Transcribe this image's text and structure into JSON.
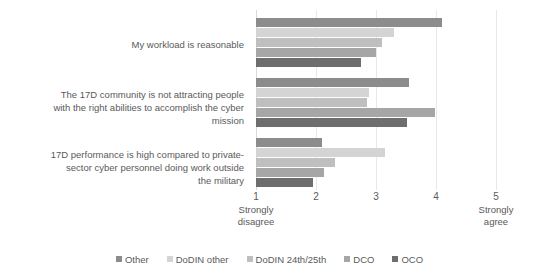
{
  "chart_data": {
    "type": "bar",
    "orientation": "horizontal",
    "title": "",
    "xlabel": "",
    "ylabel": "",
    "xlim": [
      1,
      5
    ],
    "xticks": [
      1,
      2,
      3,
      4,
      5
    ],
    "xtick_labels": [
      "1",
      "2",
      "3",
      "4",
      "5"
    ],
    "xtick_sublabels": [
      [
        "Strongly",
        "disagree"
      ],
      [],
      [],
      [],
      [
        "Strongly",
        "agree"
      ]
    ],
    "grid": true,
    "legend_position": "bottom",
    "categories": [
      "My workload is reasonable",
      "The 17D community is not attracting people with the right abilities to accomplish the cyber mission",
      "17D performance is high compared to private-sector cyber personnel doing work outside the military"
    ],
    "category_lines": [
      [
        "My workload is reasonable"
      ],
      [
        "The 17D community is not attracting people",
        "with the right abilities to accomplish the cyber",
        "mission"
      ],
      [
        "17D performance is high compared to private-",
        "sector cyber personnel doing work outside",
        "the military"
      ]
    ],
    "series": [
      {
        "name": "Other",
        "color": "#8c8c8c",
        "values": [
          4.1,
          3.55,
          2.1
        ]
      },
      {
        "name": "DoDIN other",
        "color": "#d4d4d4",
        "values": [
          3.3,
          2.88,
          3.15
        ]
      },
      {
        "name": "DoDIN 24th/25th",
        "color": "#bfbfbf",
        "values": [
          3.1,
          2.85,
          2.32
        ]
      },
      {
        "name": "DCO",
        "color": "#a6a6a6",
        "values": [
          3.0,
          3.98,
          2.14
        ]
      },
      {
        "name": "OCO",
        "color": "#6e6e6e",
        "values": [
          2.75,
          3.52,
          1.95
        ]
      }
    ]
  },
  "legend": {
    "items": [
      {
        "label": "Other",
        "color": "#8c8c8c"
      },
      {
        "label": "DoDIN other",
        "color": "#d4d4d4"
      },
      {
        "label": "DoDIN 24th/25th",
        "color": "#bfbfbf"
      },
      {
        "label": "DCO",
        "color": "#a6a6a6"
      },
      {
        "label": "OCO",
        "color": "#6e6e6e"
      }
    ]
  }
}
